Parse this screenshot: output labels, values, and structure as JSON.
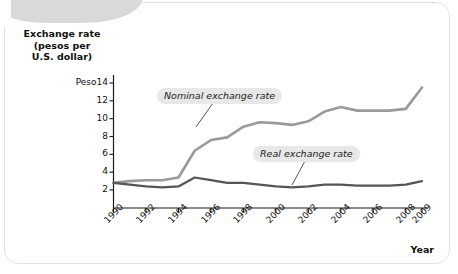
{
  "chart_data": {
    "type": "line",
    "ylabel": "Exchange rate (pesos per U.S. dollar)",
    "xlabel": "Year",
    "y_unit_prefix": "Peso",
    "ylim": [
      0,
      14
    ],
    "xlim": [
      1990,
      2009
    ],
    "grid": false,
    "legend_position": "inline-annotations",
    "ytick_labels": [
      "Peso14",
      "12",
      "10",
      "8",
      "6",
      "4",
      "2"
    ],
    "ytick_values": [
      14,
      12,
      10,
      8,
      6,
      4,
      2
    ],
    "xtick_labels": [
      "1990",
      "1992",
      "1994",
      "1996",
      "1998",
      "2000",
      "2002",
      "2004",
      "2006",
      "2008",
      "2009"
    ],
    "xtick_values": [
      1990,
      1992,
      1994,
      1996,
      1998,
      2000,
      2002,
      2004,
      2006,
      2008,
      2009
    ],
    "x": [
      1990,
      1991,
      1992,
      1993,
      1994,
      1995,
      1996,
      1997,
      1998,
      1999,
      2000,
      2001,
      2002,
      2003,
      2004,
      2005,
      2006,
      2007,
      2008,
      2009
    ],
    "series": [
      {
        "name": "Nominal exchange rate",
        "color": "#9a9a9a",
        "values": [
          2.8,
          3.0,
          3.1,
          3.1,
          3.4,
          6.4,
          7.6,
          7.9,
          9.1,
          9.6,
          9.5,
          9.3,
          9.7,
          10.8,
          11.3,
          10.9,
          10.9,
          10.9,
          11.1,
          13.5
        ]
      },
      {
        "name": "Real exchange rate",
        "color": "#555555",
        "values": [
          2.8,
          2.6,
          2.4,
          2.3,
          2.4,
          3.4,
          3.1,
          2.8,
          2.8,
          2.6,
          2.4,
          2.3,
          2.4,
          2.6,
          2.6,
          2.5,
          2.5,
          2.5,
          2.6,
          3.0
        ]
      }
    ],
    "annotations": [
      {
        "label": "Nominal exchange rate",
        "anchor_x": 1995,
        "anchor_y": 6.6
      },
      {
        "label": "Real exchange rate",
        "anchor_x": 2002,
        "anchor_y": 2.5
      }
    ]
  },
  "axis": {
    "y_title_line1": "Exchange rate",
    "y_title_line2": "(pesos per",
    "y_title_line3": "U.S. dollar)",
    "x_title": "Year"
  }
}
